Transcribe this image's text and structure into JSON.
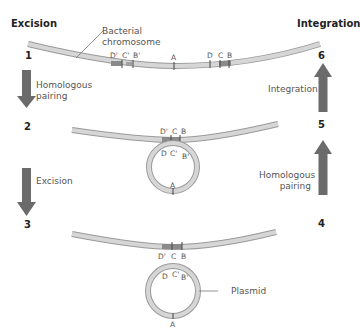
{
  "headers": {
    "left": "Excision",
    "right": "Integration"
  },
  "steps": {
    "s1": "1",
    "s2": "2",
    "s3": "3",
    "s4": "4",
    "s5": "5",
    "s6": "6"
  },
  "labels": {
    "chromosome_line1": "Bacterial",
    "chromosome_line2": "chromosome",
    "homologous_left_1": "Homologous",
    "homologous_left_2": "pairing",
    "excision": "Excision",
    "integration": "Integration",
    "homologous_right_1": "Homologous",
    "homologous_right_2": "pairing",
    "plasmid": "Plasmid"
  },
  "markers": {
    "top": {
      "d1": "D'",
      "c1": "C'",
      "b1": "B'",
      "a": "A",
      "d": "D",
      "c": "C",
      "b": "B"
    },
    "mid_chrom": {
      "d1": "D'",
      "c": "C",
      "b": "B"
    },
    "mid_ring": {
      "d": "D",
      "c1": "C'",
      "b1": "B'",
      "a": "A"
    },
    "bot_chrom": {
      "d1": "D'",
      "c": "C",
      "b": "B"
    },
    "bot_ring": {
      "d": "D",
      "c1": "C'",
      "b1": "B'",
      "a": "A"
    }
  },
  "colors": {
    "arrow": "#6b6b6b",
    "strand": "#c4c4c4",
    "strand_edge": "#9a9a9a",
    "segment": "#8a8a8a"
  }
}
